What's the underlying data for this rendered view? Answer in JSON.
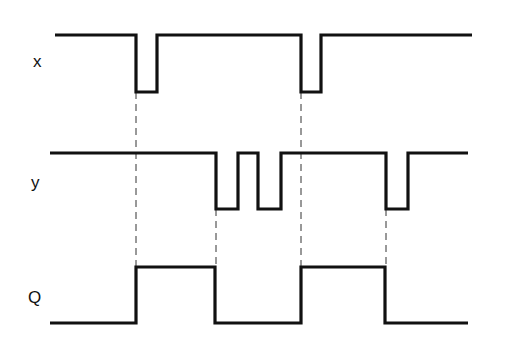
{
  "diagram": {
    "type": "timing-diagram",
    "colors": {
      "signal": "#111111",
      "guide": "#333333",
      "background": "#ffffff"
    },
    "signals": [
      {
        "name": "x",
        "label": "x",
        "label_pos": [
          33,
          53
        ],
        "high_y": 35,
        "low_y": 92,
        "start_x": 55,
        "end_x": 472,
        "initial": "high",
        "transitions": [
          136,
          157,
          301,
          321
        ]
      },
      {
        "name": "y",
        "label": "y",
        "label_pos": [
          31,
          174
        ],
        "high_y": 153,
        "low_y": 209,
        "start_x": 50,
        "end_x": 468,
        "initial": "high",
        "transitions": [
          216,
          238,
          258,
          281,
          386,
          408
        ]
      },
      {
        "name": "Q",
        "label": "Q",
        "label_pos": [
          28,
          289
        ],
        "high_y": 267,
        "low_y": 323,
        "start_x": 50,
        "end_x": 468,
        "initial": "low",
        "transitions": [
          136,
          215,
          301,
          385
        ]
      }
    ],
    "guides": [
      {
        "x": 136,
        "y1": 92,
        "y2": 267
      },
      {
        "x": 216,
        "y1": 209,
        "y2": 267
      },
      {
        "x": 301,
        "y1": 92,
        "y2": 267
      },
      {
        "x": 386,
        "y1": 209,
        "y2": 267
      }
    ]
  }
}
